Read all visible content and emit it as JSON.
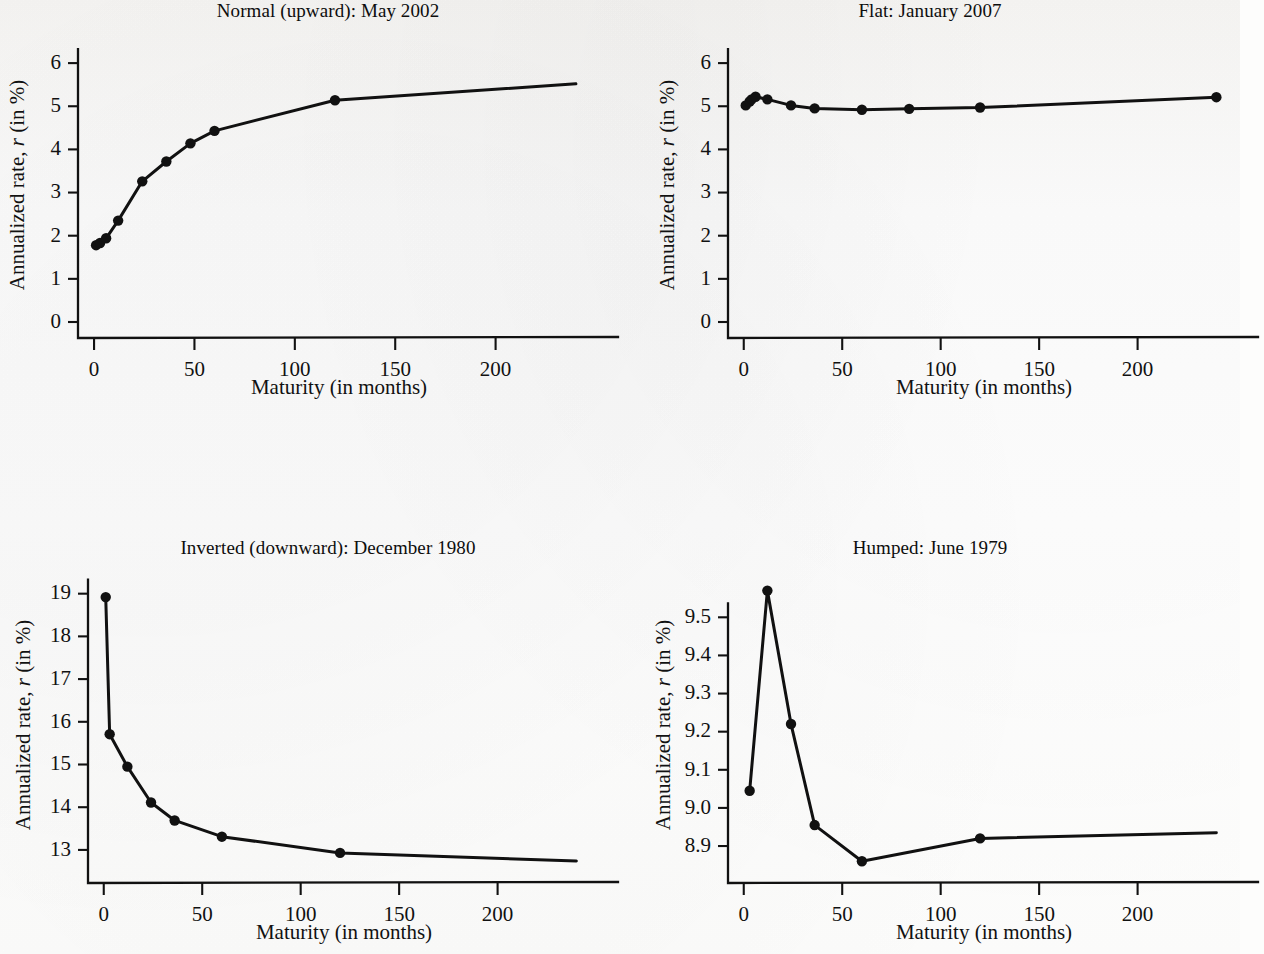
{
  "figure": {
    "axis_label_x": "Maturity (in months)",
    "axis_label_y_pre": "Annualized rate, ",
    "axis_label_y_italic": "r",
    "axis_label_y_post": " (in %)",
    "line_color": "#111111",
    "background_color": "#fdfdfc"
  },
  "chart_data": [
    {
      "id": "normal",
      "type": "line",
      "title": "Normal (upward): May 2002",
      "xlabel": "Maturity (in months)",
      "ylabel": "Annualized rate, r (in %)",
      "xlim": [
        -8,
        252
      ],
      "ylim": [
        0,
        6.35
      ],
      "xticks": [
        0,
        50,
        100,
        150,
        200
      ],
      "xticklabels": [
        "0",
        "50",
        "100",
        "150",
        "200"
      ],
      "yticks": [
        0,
        1,
        2,
        3,
        4,
        5,
        6
      ],
      "yticklabels": [
        "0",
        "1",
        "2",
        "3",
        "4",
        "5",
        "6"
      ],
      "grid": false,
      "legend": "none",
      "x": [
        1,
        3,
        6,
        12,
        24,
        36,
        48,
        60,
        120,
        240
      ],
      "values": [
        1.78,
        1.83,
        1.94,
        2.35,
        3.26,
        3.72,
        4.14,
        4.43,
        5.14,
        5.52
      ],
      "markers": [
        true,
        true,
        true,
        true,
        true,
        true,
        true,
        true,
        true,
        false
      ]
    },
    {
      "id": "flat",
      "type": "line",
      "title": "Flat: January 2007",
      "xlabel": "Maturity (in months)",
      "ylabel": "Annualized rate, r (in %)",
      "xlim": [
        -8,
        252
      ],
      "ylim": [
        0,
        6.35
      ],
      "xticks": [
        0,
        50,
        100,
        150,
        200
      ],
      "xticklabels": [
        "0",
        "50",
        "100",
        "150",
        "200"
      ],
      "yticks": [
        0,
        1,
        2,
        3,
        4,
        5,
        6
      ],
      "yticklabels": [
        "0",
        "1",
        "2",
        "3",
        "4",
        "5",
        "6"
      ],
      "grid": false,
      "legend": "none",
      "x": [
        1,
        3,
        4,
        6,
        12,
        24,
        36,
        60,
        84,
        120,
        240
      ],
      "values": [
        5.02,
        5.11,
        5.16,
        5.22,
        5.16,
        5.02,
        4.95,
        4.92,
        4.94,
        4.97,
        5.21
      ],
      "markers": [
        true,
        true,
        true,
        true,
        true,
        true,
        true,
        true,
        true,
        true,
        true
      ]
    },
    {
      "id": "inverted",
      "type": "line",
      "title": "Inverted (downward): December 1980",
      "xlabel": "Maturity (in months)",
      "ylabel": "Annualized rate, r (in %)",
      "xlim": [
        -8,
        252
      ],
      "ylim": [
        12.6,
        19.25
      ],
      "xticks": [
        0,
        50,
        100,
        150,
        200
      ],
      "xticklabels": [
        "0",
        "50",
        "100",
        "150",
        "200"
      ],
      "yticks": [
        13,
        14,
        15,
        16,
        17,
        18,
        19
      ],
      "yticklabels": [
        "13",
        "14",
        "15",
        "16",
        "17",
        "18",
        "19"
      ],
      "grid": false,
      "legend": "none",
      "x": [
        1,
        3,
        12,
        24,
        36,
        60,
        120,
        240
      ],
      "values": [
        18.92,
        15.71,
        14.95,
        14.11,
        13.69,
        13.31,
        12.93,
        12.74
      ],
      "markers": [
        true,
        true,
        true,
        true,
        true,
        true,
        true,
        false
      ]
    },
    {
      "id": "humped",
      "type": "line",
      "title": "Humped: June 1979",
      "xlabel": "Maturity (in months)",
      "ylabel": "Annualized rate, r (in %)",
      "xlim": [
        -8,
        252
      ],
      "ylim": [
        8.845,
        9.59
      ],
      "xticks": [
        0,
        50,
        100,
        150,
        200
      ],
      "xticklabels": [
        "0",
        "50",
        "100",
        "150",
        "200"
      ],
      "yticks": [
        8.9,
        9.0,
        9.1,
        9.2,
        9.3,
        9.4,
        9.5
      ],
      "yticklabels": [
        "8.9",
        "9.0",
        "9.1",
        "9.2",
        "9.3",
        "9.4",
        "9.5"
      ],
      "grid": false,
      "legend": "none",
      "x": [
        3,
        12,
        24,
        36,
        60,
        120,
        240
      ],
      "values": [
        9.045,
        9.57,
        9.22,
        8.955,
        8.86,
        8.92,
        8.935
      ],
      "markers": [
        true,
        true,
        true,
        true,
        true,
        true,
        false
      ]
    }
  ]
}
